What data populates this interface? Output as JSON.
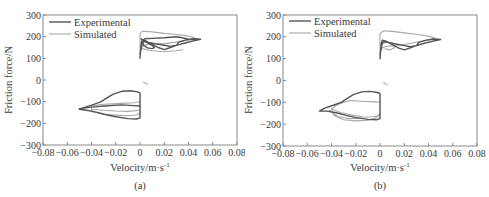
{
  "chart_data": [
    {
      "type": "line",
      "panel_label": "(a)",
      "xlabel": "Velocity/m·s",
      "xlabel_sup": "-1",
      "ylabel": "Friction force/N",
      "xlim": [
        -0.08,
        0.08
      ],
      "ylim": [
        -300,
        300
      ],
      "xticks": [
        -0.08,
        -0.06,
        -0.04,
        -0.02,
        0,
        0.02,
        0.04,
        0.06,
        0.08
      ],
      "xtick_labels": [
        "−0.08",
        "−0.06",
        "−0.04",
        "−0.02",
        "0",
        "0.02",
        "0.04",
        "0.06",
        "0.08"
      ],
      "yticks": [
        300,
        200,
        100,
        0,
        -100,
        -200,
        -300
      ],
      "ytick_labels": [
        "300",
        "200",
        "100",
        "0",
        "−100",
        "−200",
        "−300"
      ],
      "grid": false,
      "legend_position": "upper left",
      "legend": [
        "Experimental",
        "Simulated"
      ],
      "series": [
        {
          "name": "Experimental",
          "color": "#555555",
          "width": 1.4,
          "paths": [
            [
              [
                0.0,
                100
              ],
              [
                0.001,
                170
              ],
              [
                0.002,
                185
              ],
              [
                0.005,
                180
              ],
              [
                0.01,
                165
              ],
              [
                0.015,
                150
              ],
              [
                0.02,
                140
              ],
              [
                0.025,
                150
              ],
              [
                0.03,
                160
              ],
              [
                0.033,
                165
              ],
              [
                0.038,
                172
              ],
              [
                0.045,
                182
              ],
              [
                0.05,
                188
              ],
              [
                0.045,
                190
              ],
              [
                0.038,
                185
              ],
              [
                0.032,
                175
              ],
              [
                0.03,
                160
              ],
              [
                0.025,
                155
              ],
              [
                0.02,
                160
              ],
              [
                0.012,
                168
              ],
              [
                0.006,
                175
              ],
              [
                0.003,
                178
              ],
              [
                0.002,
                170
              ],
              [
                0.0,
                120
              ]
            ],
            [
              [
                0.001,
                190
              ],
              [
                0.005,
                175
              ],
              [
                0.01,
                160
              ],
              [
                0.012,
                150
              ],
              [
                0.01,
                145
              ],
              [
                0.006,
                148
              ],
              [
                0.003,
                160
              ],
              [
                0.002,
                180
              ],
              [
                0.004,
                190
              ],
              [
                0.01,
                192
              ],
              [
                0.02,
                195
              ],
              [
                0.03,
                200
              ],
              [
                0.035,
                195
              ],
              [
                0.04,
                188
              ],
              [
                0.045,
                185
              ]
            ],
            [
              [
                0.0,
                -60
              ],
              [
                -0.002,
                -55
              ],
              [
                -0.008,
                -50
              ],
              [
                -0.015,
                -52
              ],
              [
                -0.022,
                -65
              ],
              [
                -0.028,
                -85
              ],
              [
                -0.032,
                -100
              ],
              [
                -0.038,
                -112
              ],
              [
                -0.045,
                -125
              ],
              [
                -0.05,
                -135
              ],
              [
                -0.044,
                -140
              ],
              [
                -0.036,
                -148
              ],
              [
                -0.028,
                -160
              ],
              [
                -0.02,
                -170
              ],
              [
                -0.01,
                -178
              ],
              [
                -0.003,
                -180
              ],
              [
                0.0,
                -175
              ],
              [
                0.0,
                -60
              ]
            ],
            [
              [
                0.0,
                -120
              ],
              [
                -0.005,
                -118
              ],
              [
                -0.015,
                -115
              ],
              [
                -0.03,
                -120
              ],
              [
                -0.04,
                -125
              ],
              [
                -0.05,
                -132
              ]
            ]
          ]
        },
        {
          "name": "Simulated",
          "color": "#a8a8a8",
          "width": 1.1,
          "paths": [
            [
              [
                0.0,
                120
              ],
              [
                0.0,
                215
              ],
              [
                0.002,
                225
              ],
              [
                0.01,
                222
              ],
              [
                0.02,
                215
              ],
              [
                0.03,
                210
              ],
              [
                0.038,
                205
              ],
              [
                0.045,
                195
              ],
              [
                0.04,
                185
              ],
              [
                0.03,
                175
              ],
              [
                0.02,
                168
              ],
              [
                0.01,
                165
              ],
              [
                0.004,
                162
              ],
              [
                0.001,
                150
              ],
              [
                0.0,
                120
              ]
            ],
            [
              [
                0.002,
                145
              ],
              [
                0.005,
                140
              ],
              [
                0.01,
                135
              ],
              [
                0.02,
                130
              ],
              [
                0.03,
                135
              ],
              [
                0.035,
                140
              ]
            ],
            [
              [
                0.003,
                -10
              ],
              [
                0.006,
                -20
              ]
            ],
            [
              [
                0.0,
                -100
              ],
              [
                -0.005,
                -105
              ],
              [
                -0.015,
                -108
              ],
              [
                -0.03,
                -112
              ],
              [
                -0.04,
                -118
              ],
              [
                -0.04,
                -145
              ],
              [
                -0.03,
                -158
              ],
              [
                -0.02,
                -162
              ],
              [
                -0.01,
                -165
              ],
              [
                -0.002,
                -160
              ],
              [
                0.0,
                -150
              ]
            ],
            [
              [
                -0.04,
                -135
              ],
              [
                -0.03,
                -140
              ],
              [
                -0.02,
                -143
              ],
              [
                -0.01,
                -145
              ],
              [
                0.0,
                -140
              ]
            ]
          ]
        }
      ]
    },
    {
      "type": "line",
      "panel_label": "(b)",
      "xlabel": "Velocity/m·s",
      "xlabel_sup": "-1",
      "ylabel": "Friction force/N",
      "xlim": [
        -0.08,
        0.08
      ],
      "ylim": [
        -300,
        300
      ],
      "xticks": [
        -0.08,
        -0.06,
        -0.04,
        -0.02,
        0,
        0.02,
        0.04,
        0.06,
        0.08
      ],
      "xtick_labels": [
        "−0.08",
        "−0.06",
        "−0.04",
        "−0.02",
        "0",
        "0.02",
        "0.04",
        "0.06",
        "0.08"
      ],
      "yticks": [
        300,
        200,
        100,
        0,
        -100,
        -200,
        -300
      ],
      "ytick_labels": [
        "300",
        "200",
        "100",
        "0",
        "−100",
        "−200",
        "−300"
      ],
      "grid": false,
      "legend_position": "upper left",
      "legend": [
        "Experimental",
        "Simulated"
      ],
      "series": [
        {
          "name": "Experimental",
          "color": "#555555",
          "width": 1.4,
          "paths": [
            [
              [
                0.0,
                100
              ],
              [
                0.001,
                170
              ],
              [
                0.002,
                185
              ],
              [
                0.005,
                180
              ],
              [
                0.01,
                165
              ],
              [
                0.015,
                150
              ],
              [
                0.02,
                140
              ],
              [
                0.025,
                150
              ],
              [
                0.03,
                160
              ],
              [
                0.033,
                165
              ],
              [
                0.038,
                172
              ],
              [
                0.045,
                182
              ],
              [
                0.05,
                188
              ],
              [
                0.045,
                190
              ],
              [
                0.038,
                185
              ],
              [
                0.032,
                175
              ],
              [
                0.03,
                160
              ],
              [
                0.025,
                155
              ],
              [
                0.02,
                160
              ],
              [
                0.012,
                168
              ],
              [
                0.006,
                175
              ],
              [
                0.003,
                178
              ],
              [
                0.002,
                170
              ],
              [
                0.0,
                120
              ]
            ],
            [
              [
                0.0,
                -60
              ],
              [
                -0.002,
                -55
              ],
              [
                -0.008,
                -50
              ],
              [
                -0.015,
                -52
              ],
              [
                -0.022,
                -65
              ],
              [
                -0.028,
                -85
              ],
              [
                -0.032,
                -100
              ],
              [
                -0.038,
                -112
              ],
              [
                -0.045,
                -125
              ],
              [
                -0.05,
                -140
              ],
              [
                -0.044,
                -140
              ],
              [
                -0.036,
                -148
              ],
              [
                -0.028,
                -160
              ],
              [
                -0.02,
                -170
              ],
              [
                -0.01,
                -178
              ],
              [
                -0.003,
                -180
              ],
              [
                0.0,
                -175
              ],
              [
                0.0,
                -60
              ]
            ]
          ]
        },
        {
          "name": "Simulated",
          "color": "#a8a8a8",
          "width": 1.1,
          "paths": [
            [
              [
                0.0,
                120
              ],
              [
                0.0,
                215
              ],
              [
                0.003,
                228
              ],
              [
                0.01,
                225
              ],
              [
                0.02,
                218
              ],
              [
                0.03,
                212
              ],
              [
                0.038,
                205
              ],
              [
                0.045,
                195
              ],
              [
                0.04,
                185
              ],
              [
                0.03,
                175
              ],
              [
                0.02,
                165
              ],
              [
                0.01,
                160
              ],
              [
                0.004,
                155
              ],
              [
                0.001,
                145
              ],
              [
                0.0,
                120
              ]
            ],
            [
              [
                0.002,
                170
              ],
              [
                0.006,
                175
              ],
              [
                0.01,
                165
              ],
              [
                0.012,
                150
              ],
              [
                0.008,
                140
              ],
              [
                0.004,
                145
              ]
            ],
            [
              [
                0.003,
                -10
              ],
              [
                0.006,
                -20
              ]
            ],
            [
              [
                0.0,
                -100
              ],
              [
                -0.005,
                -98
              ],
              [
                -0.015,
                -95
              ],
              [
                -0.025,
                -92
              ],
              [
                -0.035,
                -110
              ],
              [
                -0.04,
                -130
              ],
              [
                -0.038,
                -160
              ],
              [
                -0.03,
                -180
              ],
              [
                -0.02,
                -185
              ],
              [
                -0.01,
                -182
              ],
              [
                -0.003,
                -170
              ],
              [
                0.0,
                -150
              ]
            ],
            [
              [
                -0.04,
                -130
              ],
              [
                -0.032,
                -148
              ],
              [
                -0.022,
                -160
              ],
              [
                -0.012,
                -168
              ],
              [
                -0.004,
                -165
              ],
              [
                0.0,
                -160
              ]
            ],
            [
              [
                -0.042,
                -135
              ],
              [
                -0.035,
                -165
              ],
              [
                -0.025,
                -175
              ],
              [
                -0.015,
                -172
              ]
            ]
          ]
        }
      ]
    }
  ]
}
